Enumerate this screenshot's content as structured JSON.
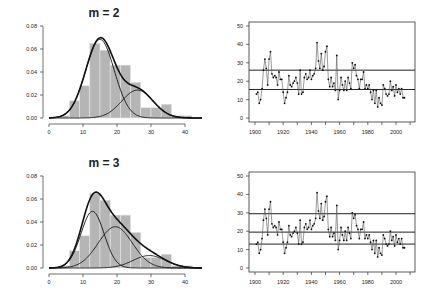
{
  "chart_data": [
    {
      "panel": "top-left",
      "type": "bar",
      "subtype": "histogram-with-mixture-density",
      "title": "m = 2",
      "xlabel": "",
      "ylabel": "",
      "xlim": [
        0,
        45
      ],
      "ylim": [
        0,
        0.08
      ],
      "x_ticks": [
        0,
        10,
        20,
        30,
        40
      ],
      "y_ticks": [
        "0.00",
        "0.02",
        "0.04",
        "0.06",
        "0.08"
      ],
      "bin_edges": [
        3,
        6,
        9,
        12,
        15,
        18,
        21,
        24,
        27,
        30,
        33,
        36,
        39,
        42
      ],
      "values": [
        0.002,
        0.015,
        0.028,
        0.065,
        0.059,
        0.046,
        0.046,
        0.031,
        0.009,
        0.009,
        0.012,
        0.002,
        0.002
      ],
      "components": [
        {
          "name": "component 1",
          "weight": 0.72,
          "mean": 15,
          "sd": 4.2
        },
        {
          "name": "component 2",
          "weight": 0.28,
          "mean": 26,
          "sd": 4.6
        }
      ],
      "grid": false
    },
    {
      "panel": "top-right",
      "type": "line",
      "title": "",
      "xlabel": "",
      "ylabel": "",
      "xlim": [
        1895,
        2012
      ],
      "ylim": [
        0,
        50
      ],
      "x_ticks": [
        1900,
        1920,
        1940,
        1960,
        1980,
        2000
      ],
      "y_ticks": [
        0,
        10,
        20,
        30,
        40,
        50
      ],
      "x": [
        1901,
        1902,
        1903,
        1904,
        1905,
        1906,
        1907,
        1908,
        1909,
        1910,
        1911,
        1912,
        1913,
        1914,
        1915,
        1916,
        1917,
        1918,
        1919,
        1920,
        1921,
        1922,
        1923,
        1924,
        1925,
        1926,
        1927,
        1928,
        1929,
        1930,
        1931,
        1932,
        1933,
        1934,
        1935,
        1936,
        1937,
        1938,
        1939,
        1940,
        1941,
        1942,
        1943,
        1944,
        1945,
        1946,
        1947,
        1948,
        1949,
        1950,
        1951,
        1952,
        1953,
        1954,
        1955,
        1956,
        1957,
        1958,
        1959,
        1960,
        1961,
        1962,
        1963,
        1964,
        1965,
        1966,
        1967,
        1968,
        1969,
        1970,
        1971,
        1972,
        1973,
        1974,
        1975,
        1976,
        1977,
        1978,
        1979,
        1980,
        1981,
        1982,
        1983,
        1984,
        1985,
        1986,
        1987,
        1988,
        1989,
        1990,
        1991,
        1992,
        1993,
        1994,
        1995,
        1996,
        1997,
        1998,
        1999,
        2000,
        2001,
        2002,
        2003,
        2004,
        2005,
        2006
      ],
      "values": [
        13,
        14,
        8,
        10,
        16,
        26,
        32,
        27,
        18,
        32,
        36,
        24,
        22,
        23,
        22,
        18,
        25,
        21,
        21,
        14,
        8,
        11,
        14,
        23,
        18,
        17,
        19,
        20,
        22,
        19,
        13,
        26,
        13,
        14,
        22,
        24,
        21,
        22,
        26,
        21,
        23,
        24,
        27,
        41,
        31,
        27,
        35,
        26,
        28,
        36,
        39,
        21,
        17,
        22,
        17,
        19,
        15,
        34,
        10,
        15,
        22,
        18,
        15,
        20,
        15,
        22,
        19,
        16,
        30,
        27,
        29,
        23,
        21,
        16,
        21,
        21,
        25,
        16,
        18,
        16,
        18,
        14,
        10,
        15,
        8,
        15,
        6,
        11,
        8,
        7,
        18,
        16,
        13,
        12,
        13,
        20,
        15,
        17,
        12,
        18,
        14,
        16,
        13,
        16,
        11,
        11
      ],
      "hlines": [
        26,
        15.5
      ],
      "grid": false
    },
    {
      "panel": "bottom-left",
      "type": "bar",
      "subtype": "histogram-with-mixture-density",
      "title": "m = 3",
      "xlabel": "",
      "ylabel": "",
      "xlim": [
        0,
        45
      ],
      "ylim": [
        0,
        0.08
      ],
      "x_ticks": [
        0,
        10,
        20,
        30,
        40
      ],
      "y_ticks": [
        "0.00",
        "0.02",
        "0.04",
        "0.06",
        "0.08"
      ],
      "bin_edges": [
        3,
        6,
        9,
        12,
        15,
        18,
        21,
        24,
        27,
        30,
        33,
        36,
        39,
        42
      ],
      "values": [
        0.002,
        0.015,
        0.028,
        0.065,
        0.059,
        0.046,
        0.046,
        0.031,
        0.009,
        0.009,
        0.012,
        0.002,
        0.002
      ],
      "components": [
        {
          "name": "component 1",
          "weight": 0.42,
          "mean": 12.8,
          "sd": 3.4
        },
        {
          "name": "component 2",
          "weight": 0.45,
          "mean": 19.5,
          "sd": 5.0
        },
        {
          "name": "component 3",
          "weight": 0.13,
          "mean": 29.5,
          "sd": 4.8
        }
      ],
      "grid": false
    },
    {
      "panel": "bottom-right",
      "type": "line",
      "title": "",
      "xlabel": "",
      "ylabel": "",
      "xlim": [
        1895,
        2012
      ],
      "ylim": [
        0,
        50
      ],
      "x_ticks": [
        1900,
        1920,
        1940,
        1960,
        1980,
        2000
      ],
      "y_ticks": [
        0,
        10,
        20,
        30,
        40,
        50
      ],
      "same_series_as": "top-right",
      "hlines": [
        29.5,
        19.5,
        13
      ],
      "grid": false
    }
  ],
  "panels": {
    "top_left_title": "m = 2",
    "bottom_left_title": "m = 3"
  },
  "colors": {
    "bar_fill": "#b5b5b5",
    "bar_edge": "#e6e6e6",
    "curve": "#111111",
    "series": "#555555",
    "axis": "#333333"
  }
}
